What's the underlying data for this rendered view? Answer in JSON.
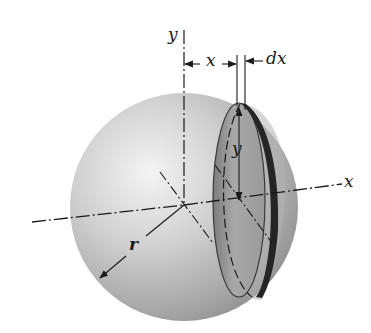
{
  "figure": {
    "labels": {
      "y_axis_top": "y",
      "x_dimension": "x",
      "dx_dimension": "dx",
      "x_axis_right": "x",
      "disk_radius_y": "y",
      "sphere_radius": "r"
    },
    "colors": {
      "sphere_light": "#f2f2f2",
      "sphere_mid": "#bdbdbd",
      "sphere_dark": "#8a8a8a",
      "disk_face": "#9e9e9e",
      "disk_rim": "#2a2a2a",
      "line": "#1a1a1a"
    }
  }
}
